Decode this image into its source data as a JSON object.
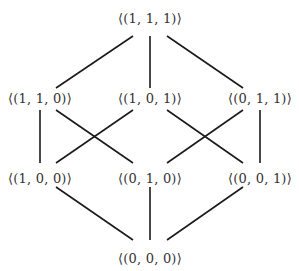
{
  "diagram": {
    "type": "hasse-diagram",
    "colors": {
      "edge": "#1a1a1a",
      "text": "#333333",
      "background": "#ffffff"
    },
    "nodes": [
      {
        "id": "n111",
        "label": "⟨(1, 1, 1)⟩",
        "x": 150,
        "y": 18
      },
      {
        "id": "n110",
        "label": "⟨(1, 1, 0)⟩",
        "x": 40,
        "y": 98
      },
      {
        "id": "n101",
        "label": "⟨(1, 0, 1)⟩",
        "x": 150,
        "y": 98
      },
      {
        "id": "n011",
        "label": "⟨(0, 1, 1)⟩",
        "x": 260,
        "y": 98
      },
      {
        "id": "n100",
        "label": "⟨(1, 0, 0)⟩",
        "x": 40,
        "y": 178
      },
      {
        "id": "n010",
        "label": "⟨(0, 1, 0)⟩",
        "x": 150,
        "y": 178
      },
      {
        "id": "n001",
        "label": "⟨(0, 0, 1)⟩",
        "x": 260,
        "y": 178
      },
      {
        "id": "n000",
        "label": "⟨(0, 0, 0)⟩",
        "x": 150,
        "y": 258
      }
    ],
    "edges": [
      {
        "from": "n111",
        "to": "n110",
        "x1": 133,
        "y1": 36,
        "x2": 56,
        "y2": 88
      },
      {
        "from": "n111",
        "to": "n101",
        "x1": 150,
        "y1": 36,
        "x2": 150,
        "y2": 88
      },
      {
        "from": "n111",
        "to": "n011",
        "x1": 167,
        "y1": 36,
        "x2": 243,
        "y2": 88
      },
      {
        "from": "n110",
        "to": "n100",
        "x1": 40,
        "y1": 110,
        "x2": 40,
        "y2": 163
      },
      {
        "from": "n110",
        "to": "n010",
        "x1": 56,
        "y1": 110,
        "x2": 133,
        "y2": 163
      },
      {
        "from": "n101",
        "to": "n100",
        "x1": 133,
        "y1": 110,
        "x2": 56,
        "y2": 163
      },
      {
        "from": "n101",
        "to": "n001",
        "x1": 167,
        "y1": 110,
        "x2": 243,
        "y2": 163
      },
      {
        "from": "n011",
        "to": "n010",
        "x1": 243,
        "y1": 110,
        "x2": 167,
        "y2": 163
      },
      {
        "from": "n011",
        "to": "n001",
        "x1": 260,
        "y1": 110,
        "x2": 260,
        "y2": 163
      },
      {
        "from": "n100",
        "to": "n000",
        "x1": 56,
        "y1": 187,
        "x2": 133,
        "y2": 240
      },
      {
        "from": "n010",
        "to": "n000",
        "x1": 150,
        "y1": 187,
        "x2": 150,
        "y2": 240
      },
      {
        "from": "n001",
        "to": "n000",
        "x1": 243,
        "y1": 187,
        "x2": 167,
        "y2": 240
      }
    ]
  }
}
